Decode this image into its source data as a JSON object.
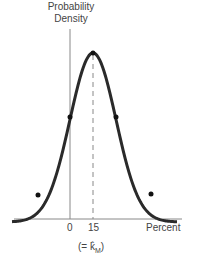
{
  "chart_data": {
    "type": "line",
    "title": "",
    "ylabel": "Probability Density",
    "xlabel": "Percent",
    "x_ticks": [
      "0",
      "15"
    ],
    "annotation": "(= k̂M)",
    "annotation_base": "(= k̂",
    "annotation_sub": "M",
    "annotation_close": ")",
    "distribution": "normal",
    "mean": 15,
    "mean_label": "15",
    "marked_points": [
      "peak at mean",
      "inflection points at mean ± 1σ",
      "points at mean ± 2σ"
    ],
    "grid": false,
    "legend": "none",
    "colors": {
      "curve": "#2a2a2a",
      "axis": "#888888",
      "dashed": "#888888"
    }
  },
  "labels": {
    "ylabel_line1": "Probability",
    "ylabel_line2": "Density",
    "tick_0": "0",
    "tick_15": "15",
    "xlabel": "Percent"
  }
}
